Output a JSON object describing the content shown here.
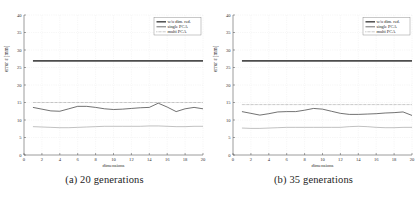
{
  "figure": {
    "panels": [
      {
        "caption": "(a) 20 generations",
        "chart_index": 0
      },
      {
        "caption": "(b) 35 generations",
        "chart_index": 1
      }
    ]
  },
  "chart_data": [
    {
      "type": "line",
      "title": "",
      "subtitle": "",
      "caption": "(a) 20 generations",
      "xlabel": "dimensions",
      "ylabel": "error ε [mm]",
      "xlim": [
        0,
        20
      ],
      "ylim": [
        0,
        40
      ],
      "xticks": [
        0,
        2,
        4,
        6,
        8,
        10,
        12,
        14,
        16,
        18,
        20
      ],
      "yticks": [
        0,
        5,
        10,
        15,
        20,
        25,
        30,
        35,
        40
      ],
      "grid": true,
      "legend_position": "top-right",
      "x": [
        1,
        2,
        3,
        4,
        5,
        6,
        7,
        8,
        9,
        10,
        11,
        12,
        13,
        14,
        15,
        16,
        17,
        18,
        19,
        20
      ],
      "series": [
        {
          "name": "w/o dim. red.",
          "style": "solid-thick",
          "color": "#4d4d4d",
          "values": [
            26.9,
            26.9,
            26.9,
            26.9,
            26.9,
            26.9,
            26.9,
            26.9,
            26.9,
            26.9,
            26.9,
            26.9,
            26.9,
            26.9,
            26.9,
            26.9,
            26.9,
            26.9,
            26.9,
            26.9
          ]
        },
        {
          "name": "single PCA",
          "style": "solid",
          "color": "#3a3a3a",
          "values": [
            13.6,
            13.1,
            12.6,
            12.5,
            13.2,
            13.9,
            13.9,
            13.6,
            13.2,
            13.0,
            13.1,
            13.3,
            13.5,
            13.6,
            14.8,
            13.7,
            12.4,
            13.2,
            13.6,
            13.2
          ]
        },
        {
          "name": "multi PCA",
          "style": "dotted",
          "color": "#606060",
          "values": [
            15.0,
            15.0,
            15.0,
            15.0,
            15.0,
            15.0,
            15.0,
            15.0,
            15.0,
            15.0,
            15.0,
            15.0,
            15.0,
            15.0,
            15.0,
            15.0,
            15.0,
            15.0,
            15.0,
            15.0
          ]
        },
        {
          "name": "lower-band",
          "style": "solid-light",
          "color": "#9a9a9a",
          "values": [
            8.1,
            8.0,
            7.9,
            7.8,
            7.8,
            7.9,
            8.0,
            8.1,
            8.2,
            8.2,
            8.2,
            8.2,
            8.2,
            8.3,
            8.3,
            8.2,
            8.1,
            8.1,
            8.2,
            8.2
          ]
        }
      ],
      "legend": [
        "w/o dim. red.",
        "single PCA",
        "multi PCA"
      ]
    },
    {
      "type": "line",
      "title": "",
      "subtitle": "",
      "caption": "(b) 35 generations",
      "xlabel": "dimensions",
      "ylabel": "error ε [mm]",
      "xlim": [
        0,
        20
      ],
      "ylim": [
        0,
        40
      ],
      "xticks": [
        0,
        2,
        4,
        6,
        8,
        10,
        12,
        14,
        16,
        18,
        20
      ],
      "yticks": [
        0,
        5,
        10,
        15,
        20,
        25,
        30,
        35,
        40
      ],
      "grid": true,
      "legend_position": "top-right",
      "x": [
        1,
        2,
        3,
        4,
        5,
        6,
        7,
        8,
        9,
        10,
        11,
        12,
        13,
        14,
        15,
        16,
        17,
        18,
        19,
        20
      ],
      "series": [
        {
          "name": "w/o dim. red.",
          "style": "solid-thick",
          "color": "#4d4d4d",
          "values": [
            26.9,
            26.9,
            26.9,
            26.9,
            26.9,
            26.9,
            26.9,
            26.9,
            26.9,
            26.9,
            26.9,
            26.9,
            26.9,
            26.9,
            26.9,
            26.9,
            26.9,
            26.9,
            26.9,
            26.9
          ]
        },
        {
          "name": "single PCA",
          "style": "solid",
          "color": "#3a3a3a",
          "values": [
            12.4,
            11.9,
            11.4,
            11.8,
            12.3,
            12.4,
            12.4,
            12.8,
            13.3,
            13.1,
            12.5,
            11.9,
            11.6,
            11.6,
            11.7,
            11.8,
            12.0,
            12.1,
            12.3,
            11.3
          ]
        },
        {
          "name": "multi PCA",
          "style": "dotted",
          "color": "#606060",
          "values": [
            14.4,
            14.4,
            14.4,
            14.4,
            14.4,
            14.4,
            14.4,
            14.4,
            14.4,
            14.4,
            14.4,
            14.4,
            14.4,
            14.4,
            14.4,
            14.4,
            14.4,
            14.4,
            14.4,
            14.4
          ]
        },
        {
          "name": "lower-band",
          "style": "solid-light",
          "color": "#9a9a9a",
          "values": [
            7.7,
            7.6,
            7.6,
            7.7,
            7.8,
            7.9,
            7.9,
            7.9,
            7.9,
            7.9,
            7.9,
            7.9,
            8.1,
            8.2,
            8.1,
            7.9,
            7.8,
            7.8,
            7.9,
            7.9
          ]
        }
      ],
      "legend": [
        "w/o dim. red.",
        "single PCA",
        "multi PCA"
      ]
    }
  ]
}
